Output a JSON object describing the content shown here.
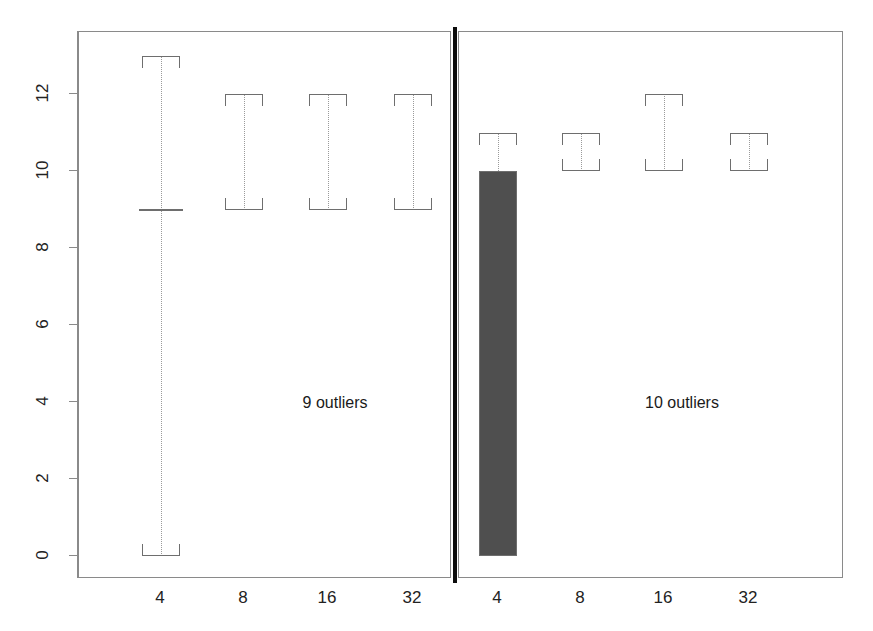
{
  "figure": {
    "width": 873,
    "height": 631,
    "background": "#ffffff",
    "divider_color": "#0d0d0d",
    "frame_color": "#8a8a8a",
    "box_line_color": "#6e6e6e",
    "whisker_color": "#9a9a9a",
    "fill_color": "#4f4f4f"
  },
  "chart_data": {
    "type": "box",
    "title": "",
    "xlabel": "",
    "ylabel": "",
    "ylim": [
      -0.7,
      13.6
    ],
    "yticks": [
      0,
      2,
      4,
      6,
      8,
      10,
      12
    ],
    "ytick_labels": [
      "0",
      "2",
      "4",
      "6",
      "8",
      "10",
      "12"
    ],
    "grid": false,
    "legend": "none",
    "panels": [
      {
        "name": "left-panel",
        "annotation": "9 outliers",
        "categories": [
          "4",
          "8",
          "16",
          "32"
        ],
        "boxes": [
          {
            "category": "4",
            "whisker_low": 0,
            "q1": 0,
            "median": 9,
            "q3": 13,
            "whisker_high": 13,
            "filled": false,
            "style": "degenerate-median"
          },
          {
            "category": "8",
            "whisker_low": 9,
            "q1": 9,
            "median": 9,
            "q3": 12,
            "whisker_high": 12,
            "filled": false,
            "style": "open-bracket"
          },
          {
            "category": "16",
            "whisker_low": 9,
            "q1": 9,
            "median": 9,
            "q3": 12,
            "whisker_high": 12,
            "filled": false,
            "style": "open-bracket"
          },
          {
            "category": "32",
            "whisker_low": 9,
            "q1": 9,
            "median": 9,
            "q3": 12,
            "whisker_high": 12,
            "filled": false,
            "style": "open-bracket"
          }
        ]
      },
      {
        "name": "right-panel",
        "annotation": "10 outliers",
        "categories": [
          "4",
          "8",
          "16",
          "32"
        ],
        "boxes": [
          {
            "category": "4",
            "whisker_low": 0,
            "q1": 0,
            "median": 0,
            "q3": 10,
            "whisker_high": 11,
            "filled": true,
            "style": "solid-fill"
          },
          {
            "category": "8",
            "whisker_low": 10,
            "q1": 10,
            "median": 10,
            "q3": 11,
            "whisker_high": 11,
            "filled": false,
            "style": "open-bracket"
          },
          {
            "category": "16",
            "whisker_low": 10,
            "q1": 10,
            "median": 10,
            "q3": 12,
            "whisker_high": 12,
            "filled": false,
            "style": "open-bracket"
          },
          {
            "category": "32",
            "whisker_low": 10,
            "q1": 10,
            "median": 10,
            "q3": 11,
            "whisker_high": 11,
            "filled": false,
            "style": "open-bracket"
          }
        ]
      }
    ]
  },
  "axes": {
    "y": {
      "ticks": [
        {
          "value": 12,
          "label": "12"
        },
        {
          "value": 10,
          "label": "10"
        },
        {
          "value": 8,
          "label": "8"
        },
        {
          "value": 6,
          "label": "6"
        },
        {
          "value": 4,
          "label": "4"
        },
        {
          "value": 2,
          "label": "2"
        },
        {
          "value": 0,
          "label": "0"
        }
      ]
    },
    "x_left": {
      "labels": [
        "4",
        "8",
        "16",
        "32"
      ]
    },
    "x_right": {
      "labels": [
        "4",
        "8",
        "16",
        "32"
      ]
    }
  },
  "annotations": {
    "left": "9 outliers",
    "right": "10 outliers"
  }
}
